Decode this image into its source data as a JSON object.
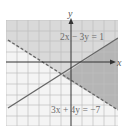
{
  "graph": {
    "x_axis_label": "x",
    "y_axis_label": "y",
    "top_partial_text": "(  )   ",
    "equations": [
      {
        "label": "2x − 3y = 1",
        "style": "solid",
        "a": 2,
        "b": -3,
        "c": 1
      },
      {
        "label": "3x + 4y = −7",
        "style": "dashed",
        "a": 3,
        "b": 4,
        "c": -7
      }
    ],
    "colors": {
      "light_shade": "#dcdcdc",
      "dark_shade": "#b8b8b8",
      "grid": "#bdbdbd",
      "axis": "#333333",
      "line": "#666666"
    },
    "x_range": [
      -6,
      4
    ],
    "y_range": [
      -5,
      5
    ]
  }
}
